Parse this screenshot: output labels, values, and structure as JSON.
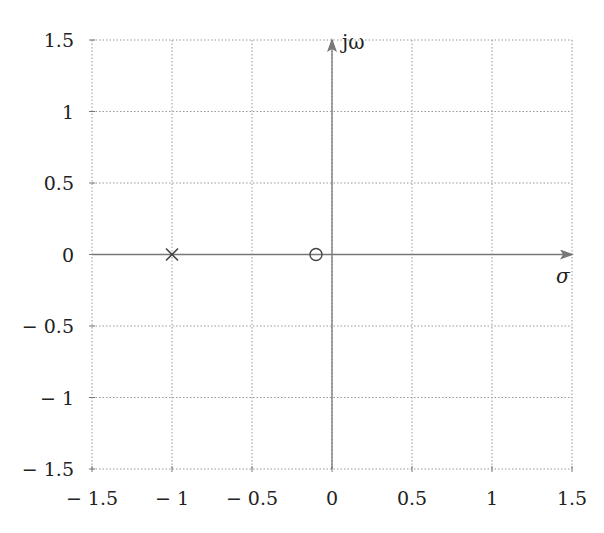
{
  "chart_data": {
    "type": "scatter",
    "title": "",
    "xlabel": "σ",
    "ylabel": "jω",
    "xlim": [
      -1.5,
      1.5
    ],
    "ylim": [
      -1.5,
      1.5
    ],
    "grid": true,
    "x_ticks": [
      -1.5,
      -1,
      -0.5,
      0,
      0.5,
      1,
      1.5
    ],
    "y_ticks": [
      -1.5,
      -1,
      -0.5,
      0,
      0.5,
      1,
      1.5
    ],
    "x_tick_labels": [
      "− 1.5",
      "− 1",
      "− 0.5",
      "0",
      "0.5",
      "1",
      "1.5"
    ],
    "y_tick_labels": [
      "− 1.5",
      "− 1",
      "− 0.5",
      "0",
      "0.5",
      "1",
      "1.5"
    ],
    "series": [
      {
        "name": "poles",
        "marker": "x",
        "points": [
          {
            "x": -1,
            "y": 0
          }
        ]
      },
      {
        "name": "zeros",
        "marker": "o",
        "points": [
          {
            "x": -0.1,
            "y": 0
          }
        ]
      }
    ]
  },
  "colors": {
    "axis": "#777777",
    "grid": "#999999",
    "marker": "#444444",
    "text": "#222222"
  }
}
